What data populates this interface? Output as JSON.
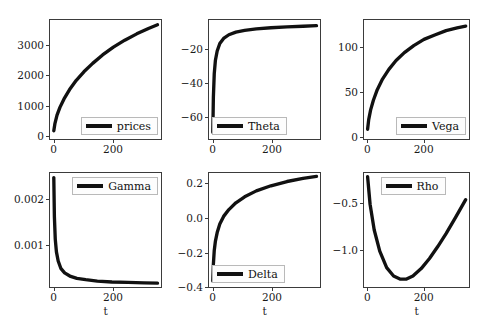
{
  "figure": {
    "layout": "2 rows x 3 columns of line plots",
    "xlabel": "t"
  },
  "chart_data": [
    {
      "type": "line",
      "name": "prices",
      "position": "row1-col1",
      "title": "",
      "xlabel": "",
      "ylabel": "",
      "legend": "prices",
      "legend_position": "lower right",
      "grid": false,
      "xlim": [
        -12,
        368
      ],
      "ylim": [
        -150,
        3800
      ],
      "xticks": [
        0,
        200
      ],
      "xticklabels": [
        "0",
        "200"
      ],
      "yticks": [
        0,
        1000,
        2000,
        3000
      ],
      "yticklabels": [
        "0",
        "1000",
        "2000",
        "3000"
      ],
      "x": [
        1,
        5,
        12,
        22,
        36,
        55,
        78,
        104,
        134,
        168,
        205,
        244,
        285,
        325,
        356
      ],
      "y": [
        120,
        370,
        640,
        900,
        1180,
        1490,
        1800,
        2080,
        2360,
        2640,
        2900,
        3130,
        3340,
        3520,
        3640
      ]
    },
    {
      "type": "line",
      "name": "Theta",
      "position": "row1-col2",
      "title": "",
      "xlabel": "",
      "ylabel": "",
      "legend": "Theta",
      "legend_position": "lower left",
      "grid": false,
      "xlim": [
        -12,
        368
      ],
      "ylim": [
        -74,
        -3
      ],
      "xticks": [
        0,
        200
      ],
      "xticklabels": [
        "0",
        "200"
      ],
      "yticks": [
        -60,
        -40,
        -20
      ],
      "yticklabels": [
        "-60",
        "-40",
        "-20"
      ],
      "x": [
        1,
        3,
        6,
        10,
        16,
        25,
        38,
        56,
        80,
        110,
        150,
        200,
        255,
        310,
        356
      ],
      "y": [
        -70.0,
        -49.0,
        -35.0,
        -27.0,
        -21.5,
        -17.0,
        -14.0,
        -11.8,
        -10.2,
        -9.2,
        -8.3,
        -7.6,
        -7.1,
        -6.7,
        -6.4
      ]
    },
    {
      "type": "line",
      "name": "Vega",
      "position": "row1-col3",
      "title": "",
      "xlabel": "",
      "ylabel": "",
      "legend": "Vega",
      "legend_position": "lower right",
      "grid": false,
      "xlim": [
        -12,
        368
      ],
      "ylim": [
        -5,
        130
      ],
      "xticks": [
        0,
        200
      ],
      "xticklabels": [
        "0",
        "200"
      ],
      "yticks": [
        0,
        50,
        100
      ],
      "yticklabels": [
        "0",
        "50",
        "100"
      ],
      "x": [
        1,
        5,
        12,
        22,
        36,
        55,
        78,
        104,
        134,
        168,
        205,
        244,
        285,
        325,
        356
      ],
      "y": [
        6,
        17,
        28,
        39,
        51,
        63,
        74,
        84,
        93,
        101,
        108,
        113,
        118,
        121,
        123
      ]
    },
    {
      "type": "line",
      "name": "Gamma",
      "position": "row2-col1",
      "title": "",
      "xlabel": "t",
      "ylabel": "",
      "legend": "Gamma",
      "legend_position": "upper right",
      "grid": false,
      "xlim": [
        -12,
        368
      ],
      "ylim": [
        5e-05,
        0.00255
      ],
      "xticks": [
        0,
        200
      ],
      "xticklabels": [
        "0",
        "200"
      ],
      "yticks": [
        0.001,
        0.002
      ],
      "yticklabels": [
        "0.001",
        "0.002"
      ],
      "x": [
        1,
        3,
        6,
        10,
        16,
        25,
        38,
        56,
        80,
        110,
        150,
        200,
        255,
        310,
        356
      ],
      "y": [
        0.00245,
        0.0016,
        0.0011,
        0.00082,
        0.00062,
        0.00046,
        0.00036,
        0.00029,
        0.00024,
        0.00021,
        0.00018,
        0.00016,
        0.00015,
        0.00014,
        0.000135
      ]
    },
    {
      "type": "line",
      "name": "Delta",
      "position": "row2-col2",
      "title": "",
      "xlabel": "t",
      "ylabel": "",
      "legend": "Delta",
      "legend_position": "lower left",
      "grid": false,
      "xlim": [
        -12,
        368
      ],
      "ylim": [
        -0.41,
        0.26
      ],
      "xticks": [
        0,
        200
      ],
      "xticklabels": [
        "0",
        "200"
      ],
      "yticks": [
        -0.4,
        -0.2,
        0.0,
        0.2
      ],
      "yticklabels": [
        "-0.4",
        "-0.2",
        "0.0",
        "0.2"
      ],
      "x": [
        1,
        3,
        6,
        10,
        16,
        25,
        38,
        56,
        80,
        110,
        150,
        200,
        255,
        310,
        356
      ],
      "y": [
        -0.375,
        -0.275,
        -0.195,
        -0.14,
        -0.09,
        -0.04,
        0.005,
        0.045,
        0.085,
        0.12,
        0.155,
        0.185,
        0.21,
        0.228,
        0.24
      ]
    },
    {
      "type": "line",
      "name": "Rho",
      "position": "row2-col3",
      "title": "",
      "xlabel": "t",
      "ylabel": "",
      "legend": "Rho",
      "legend_position": "upper center",
      "grid": false,
      "xlim": [
        -12,
        368
      ],
      "ylim": [
        -1.42,
        -0.18
      ],
      "xticks": [
        0,
        200
      ],
      "xticklabels": [
        "0",
        "200"
      ],
      "yticks": [
        -1.0,
        -0.5
      ],
      "yticklabels": [
        "-1.0",
        "-0.5"
      ],
      "x": [
        1,
        10,
        25,
        45,
        70,
        95,
        120,
        140,
        165,
        195,
        225,
        255,
        285,
        320,
        356
      ],
      "y": [
        -0.22,
        -0.52,
        -0.8,
        -1.03,
        -1.21,
        -1.3,
        -1.335,
        -1.335,
        -1.3,
        -1.22,
        -1.11,
        -0.98,
        -0.84,
        -0.66,
        -0.47
      ]
    }
  ]
}
